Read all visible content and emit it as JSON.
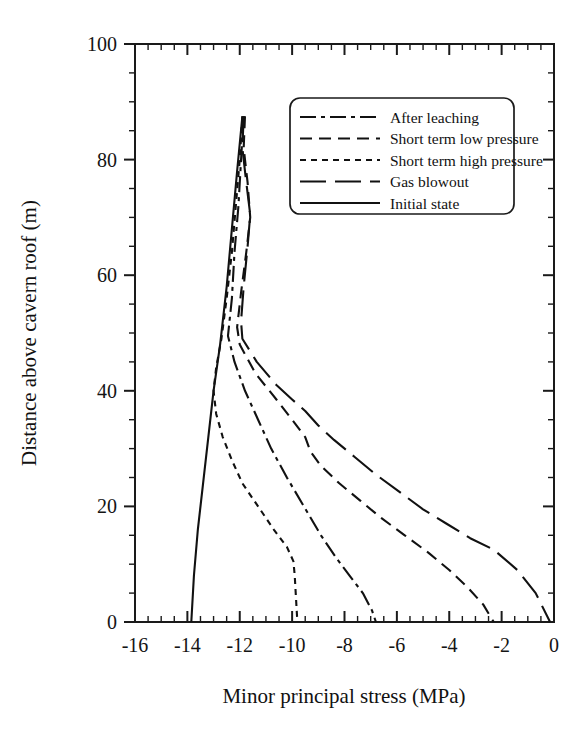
{
  "chart_data": {
    "type": "line",
    "title": "",
    "xlabel": "Minor principal stress (MPa)",
    "ylabel": "Distance above cavern roof (m)",
    "xlim": [
      -16,
      0
    ],
    "ylim": [
      0,
      100
    ],
    "xticks": [
      -16,
      -14,
      -12,
      -10,
      -8,
      -6,
      -4,
      -2,
      0
    ],
    "xticklabels": [
      "-16",
      "-14",
      "-12",
      "-10",
      "-8",
      "-6",
      "-4",
      "-2",
      "0"
    ],
    "xminor_step": 0.5,
    "yticks": [
      0,
      20,
      40,
      60,
      80,
      100
    ],
    "yticklabels": [
      "0",
      "20",
      "40",
      "60",
      "80",
      "100"
    ],
    "yminor_step": 5,
    "grid": false,
    "legend_position": "upper-right",
    "orientation": "x-is-stress-y-is-distance",
    "series": [
      {
        "name": "After leaching",
        "dash": "16,5,4,5",
        "points": [
          [
            -11.85,
            87.5
          ],
          [
            -11.95,
            80.0
          ],
          [
            -12.05,
            72.0
          ],
          [
            -12.2,
            64.0
          ],
          [
            -12.3,
            56.0
          ],
          [
            -12.45,
            49.5
          ],
          [
            -12.2,
            45.0
          ],
          [
            -11.8,
            40.0
          ],
          [
            -11.3,
            35.0
          ],
          [
            -10.8,
            30.0
          ],
          [
            -10.2,
            25.0
          ],
          [
            -9.55,
            20.0
          ],
          [
            -8.9,
            15.0
          ],
          [
            -8.3,
            11.0
          ],
          [
            -7.8,
            8.0
          ],
          [
            -7.3,
            5.0
          ],
          [
            -6.95,
            2.0
          ],
          [
            -6.8,
            0.0
          ]
        ]
      },
      {
        "name": "Short term low pressure",
        "dash": "12,7",
        "points": [
          [
            -11.8,
            87.5
          ],
          [
            -11.85,
            82.0
          ],
          [
            -11.7,
            76.0
          ],
          [
            -11.6,
            70.0
          ],
          [
            -11.75,
            64.0
          ],
          [
            -11.95,
            57.0
          ],
          [
            -12.1,
            51.0
          ],
          [
            -12.0,
            48.0
          ],
          [
            -11.4,
            43.0
          ],
          [
            -10.6,
            38.5
          ],
          [
            -10.0,
            35.0
          ],
          [
            -9.5,
            32.0
          ],
          [
            -9.3,
            29.5
          ],
          [
            -8.9,
            27.0
          ],
          [
            -8.2,
            24.0
          ],
          [
            -7.4,
            21.0
          ],
          [
            -6.6,
            18.0
          ],
          [
            -5.7,
            15.0
          ],
          [
            -4.8,
            12.0
          ],
          [
            -4.0,
            9.0
          ],
          [
            -3.3,
            6.0
          ],
          [
            -2.7,
            3.0
          ],
          [
            -2.3,
            0.0
          ]
        ]
      },
      {
        "name": "Short term high pressure",
        "dash": "6,5",
        "points": [
          [
            -11.9,
            87.5
          ],
          [
            -12.0,
            80.0
          ],
          [
            -12.15,
            72.0
          ],
          [
            -12.3,
            64.0
          ],
          [
            -12.5,
            56.0
          ],
          [
            -12.7,
            49.0
          ],
          [
            -12.9,
            44.0
          ],
          [
            -13.0,
            40.0
          ],
          [
            -12.9,
            36.0
          ],
          [
            -12.65,
            32.0
          ],
          [
            -12.3,
            28.0
          ],
          [
            -11.9,
            24.0
          ],
          [
            -11.3,
            20.0
          ],
          [
            -10.7,
            16.0
          ],
          [
            -10.2,
            13.0
          ],
          [
            -9.95,
            10.5
          ],
          [
            -9.9,
            8.0
          ],
          [
            -9.85,
            4.0
          ],
          [
            -9.8,
            0.0
          ]
        ]
      },
      {
        "name": "Gas blowout",
        "dash": "26,9",
        "points": [
          [
            -11.85,
            87.5
          ],
          [
            -11.9,
            82.0
          ],
          [
            -11.75,
            76.0
          ],
          [
            -11.6,
            70.5
          ],
          [
            -11.7,
            65.0
          ],
          [
            -11.85,
            58.0
          ],
          [
            -11.95,
            52.0
          ],
          [
            -11.9,
            49.0
          ],
          [
            -11.35,
            45.0
          ],
          [
            -10.6,
            41.0
          ],
          [
            -10.0,
            38.5
          ],
          [
            -9.5,
            36.5
          ],
          [
            -9.0,
            34.0
          ],
          [
            -8.4,
            31.5
          ],
          [
            -7.6,
            28.5
          ],
          [
            -6.8,
            25.5
          ],
          [
            -5.9,
            22.5
          ],
          [
            -5.0,
            19.5
          ],
          [
            -4.1,
            17.0
          ],
          [
            -3.2,
            14.5
          ],
          [
            -2.3,
            12.5
          ],
          [
            -1.4,
            9.0
          ],
          [
            -0.7,
            5.0
          ],
          [
            -0.15,
            0.0
          ]
        ]
      },
      {
        "name": "Initial state",
        "dash": "none",
        "points": [
          [
            -11.9,
            87.5
          ],
          [
            -12.1,
            78.0
          ],
          [
            -12.3,
            68.0
          ],
          [
            -12.5,
            58.0
          ],
          [
            -12.75,
            48.0
          ],
          [
            -13.0,
            40.0
          ],
          [
            -13.2,
            32.0
          ],
          [
            -13.4,
            24.0
          ],
          [
            -13.6,
            16.0
          ],
          [
            -13.75,
            8.0
          ],
          [
            -13.85,
            0.0
          ]
        ]
      }
    ]
  },
  "legend": {
    "entries": [
      {
        "label": "After leaching",
        "dash": "16,5,4,5"
      },
      {
        "label": "Short term low pressure",
        "dash": "12,7"
      },
      {
        "label": "Short term high pressure",
        "dash": "6,5"
      },
      {
        "label": "Gas blowout",
        "dash": "26,9"
      },
      {
        "label": "Initial state",
        "dash": "none"
      }
    ]
  },
  "colors": {
    "ink": "#111111",
    "background": "#ffffff"
  }
}
